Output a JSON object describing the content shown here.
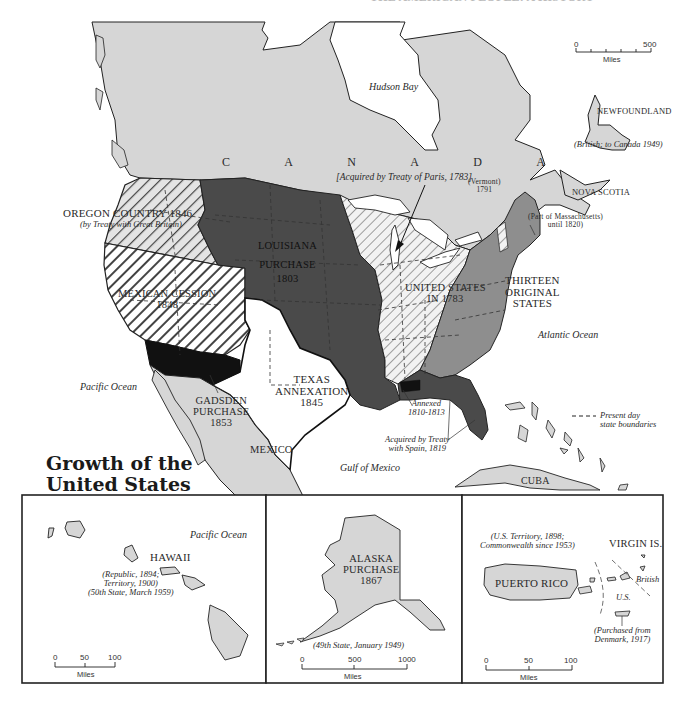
{
  "title": {
    "line1": "Growth of the",
    "line2": "United States"
  },
  "header_fragment": "THE AMERICAN PEOPLE: A HISTORY",
  "regions": {
    "canada": "C A N A D A",
    "hudson_bay": "Hudson Bay",
    "newfoundland": "NEWFOUNDLAND",
    "newfoundland_note": "(British; to Canada 1949)",
    "nova_scotia": "NOVA SCOTIA",
    "oregon": "OREGON COUNTRY 1846",
    "oregon_note": "(by Treaty with Great Britain)",
    "mexican_cession_1": "MEXICAN CESSION",
    "mexican_cession_2": "1848",
    "louisiana_1": "LOUISIANA",
    "louisiana_2": "PURCHASE",
    "louisiana_3": "1803",
    "treaty_paris": "[Acquired by Treaty of Paris, 1783]",
    "vermont_1": "(Vermont)",
    "vermont_2": "1791",
    "maine_1": "(Part of Massachusetts)",
    "maine_2": "until 1820)",
    "us1783_1": "UNITED STATES",
    "us1783_2": "IN 1783",
    "thirteen_1": "THIRTEEN",
    "thirteen_2": "ORIGINAL",
    "thirteen_3": "STATES",
    "atlantic": "Atlantic Ocean",
    "pacific": "Pacific Ocean",
    "texas_1": "TEXAS",
    "texas_2": "ANNEXATION",
    "texas_3": "1845",
    "gadsden_1": "GADSDEN",
    "gadsden_2": "PURCHASE",
    "gadsden_3": "1853",
    "mexico": "MEXICO",
    "gulf": "Gulf of Mexico",
    "annexed_1": "Annexed",
    "annexed_2": "1810-1813",
    "spain_1": "Acquired by Treaty",
    "spain_2": "with Spain, 1819",
    "cuba": "CUBA"
  },
  "legend": {
    "boundary_1": "Present day",
    "boundary_2": "state boundaries"
  },
  "main_scale": {
    "ticks": [
      "0",
      "500"
    ],
    "unit": "Miles"
  },
  "insets": {
    "hawaii": {
      "name": "HAWAII",
      "ocean": "Pacific Ocean",
      "note_1": "(Republic, 1894;",
      "note_2": "Territory, 1900)",
      "note_3": "(50th State, March 1959)",
      "scale_ticks": [
        "0",
        "50",
        "100"
      ],
      "scale_unit": "Miles"
    },
    "alaska": {
      "name_1": "ALASKA",
      "name_2": "PURCHASE",
      "name_3": "1867",
      "note": "(49th State, January 1949)",
      "scale_ticks": [
        "0",
        "500",
        "1000"
      ],
      "scale_unit": "Miles"
    },
    "caribbean": {
      "pr_note_1": "(U.S. Territory, 1898;",
      "pr_note_2": "Commonwealth since 1953)",
      "puerto_rico": "PUERTO RICO",
      "virgin": "VIRGIN IS.",
      "british": "British",
      "us": "U.S.",
      "vi_note_1": "(Purchased from",
      "vi_note_2": "Denmark, 1917)",
      "scale_ticks": [
        "0",
        "50",
        "100"
      ],
      "scale_unit": "Miles"
    }
  },
  "colors": {
    "land_foreign": "#d3d3d3",
    "louisiana": "#4a4a4a",
    "thirteen": "#8e8e8e",
    "gadsden": "#111111",
    "water": "#ffffff",
    "outline": "#222222"
  }
}
